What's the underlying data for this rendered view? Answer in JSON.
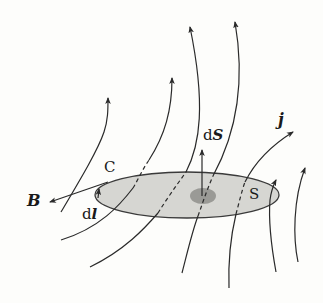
{
  "diagram": {
    "colors": {
      "background": "#fdfdfb",
      "line": "#2a2a2a",
      "surface_fill": "#d6d6d2",
      "surface_patch": "#9a9a96"
    },
    "labels": {
      "B": "B",
      "C": "C",
      "dl_d": "d",
      "dl_l": "l",
      "dS_d": "d",
      "dS_S": "S",
      "j": "j",
      "S": "S"
    },
    "elements": {
      "surface": "S (shaded ellipse)",
      "curve": "C (boundary of surface)",
      "field_lines": "current density lines j passing through S",
      "vectors": [
        "B (tangent to C)",
        "dl (line element on C)",
        "dS (surface normal)"
      ]
    }
  }
}
